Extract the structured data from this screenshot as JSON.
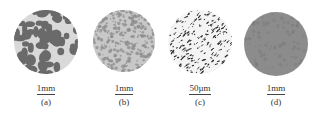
{
  "figure": {
    "panels": [
      {
        "id": "a",
        "label": "(a)",
        "scale_bar": "1mm",
        "texture": "large-dark-blobs",
        "colors": {
          "bg": "#d9d9d9",
          "fg": "#6a6a6a"
        }
      },
      {
        "id": "b",
        "label": "(b)",
        "scale_bar": "1mm",
        "texture": "fine-cellular",
        "colors": {
          "bg": "#c8c8c8",
          "fg": "#8e8e8e"
        }
      },
      {
        "id": "c",
        "label": "(c)",
        "scale_bar": "50µm",
        "texture": "sparse-dark-flecks",
        "colors": {
          "bg": "#f4f4f4",
          "fg": "#2a2a2a"
        }
      },
      {
        "id": "d",
        "label": "(d)",
        "scale_bar": "1mm",
        "texture": "uniform-gray",
        "colors": {
          "bg": "#8c8c8c",
          "fg": "#7a7a7a"
        }
      }
    ]
  }
}
